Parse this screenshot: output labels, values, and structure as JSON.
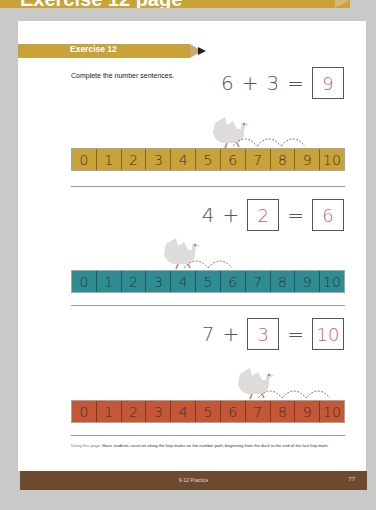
{
  "header": {
    "banner_text": "Exercise 12 page"
  },
  "exercise": {
    "title": "Exercise 12",
    "instruction": "Complete the number sentences."
  },
  "problems": [
    {
      "equation": {
        "a": "6",
        "op": "+",
        "b": "3",
        "eq": "=",
        "answer": "9"
      },
      "b_is_box": false,
      "numline_color": "#c9a23a",
      "numbers": [
        "0",
        "1",
        "2",
        "3",
        "4",
        "5",
        "6",
        "7",
        "8",
        "9",
        "10"
      ],
      "duck_at": 6,
      "hops": [
        6,
        7,
        8,
        9
      ]
    },
    {
      "equation": {
        "a": "4",
        "op": "+",
        "b": "2",
        "eq": "=",
        "answer": "6"
      },
      "b_is_box": true,
      "numline_color": "#2f8c93",
      "numbers": [
        "0",
        "1",
        "2",
        "3",
        "4",
        "5",
        "6",
        "7",
        "8",
        "9",
        "10"
      ],
      "duck_at": 4,
      "hops": [
        4,
        5,
        6
      ]
    },
    {
      "equation": {
        "a": "7",
        "op": "+",
        "b": "3",
        "eq": "=",
        "answer": "10"
      },
      "b_is_box": true,
      "numline_color": "#c45735",
      "numbers": [
        "0",
        "1",
        "2",
        "3",
        "4",
        "5",
        "6",
        "7",
        "8",
        "9",
        "10"
      ],
      "duck_at": 7,
      "hops": [
        7,
        8,
        9,
        10
      ]
    }
  ],
  "note": {
    "lead": "Using this page:",
    "text": " Have students count on along the hop marks on the number path, beginning from the duck to the end of the last hop mark."
  },
  "footer": {
    "section": "9-12 Practice",
    "page_number": "77"
  },
  "colors": {
    "gold": "#c9a23a",
    "teal": "#2f8c93",
    "rust": "#c45735",
    "footer_brown": "#6b4a30",
    "answer_pink": "#d45a6a"
  }
}
